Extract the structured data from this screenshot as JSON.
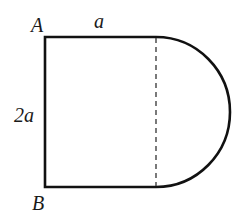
{
  "diagram": {
    "type": "geometry-figure",
    "labels": {
      "vertex_top_left": "A",
      "vertex_bottom_left": "B",
      "top_side": "a",
      "left_side": "2a"
    },
    "colors": {
      "stroke": "#111111",
      "dashed": "#333333",
      "background": "#ffffff"
    }
  }
}
